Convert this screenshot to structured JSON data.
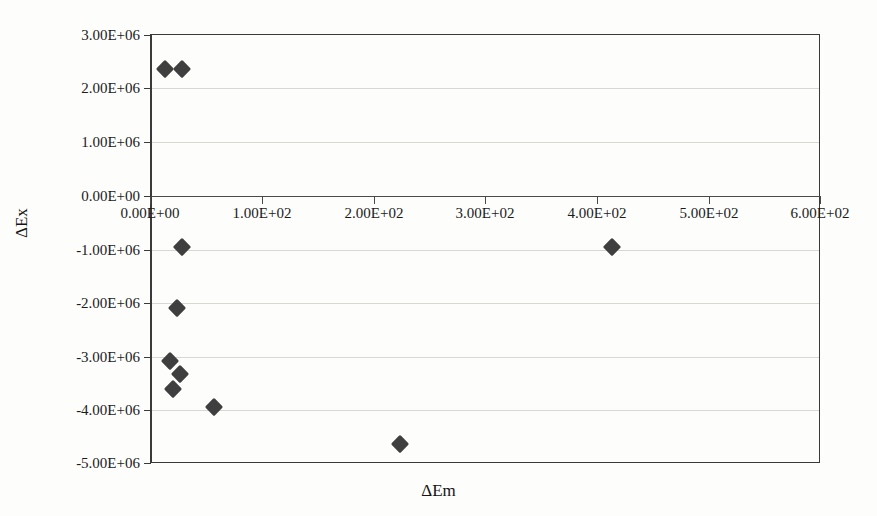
{
  "figure": {
    "background_color": "#fdfdfc",
    "marker_color": "#3f3f3f",
    "axis_color": "#3a3a3a",
    "gridline_color": "#d9d7d2"
  },
  "chart_data": {
    "type": "scatter",
    "title": "",
    "xlabel": "ΔEm",
    "ylabel": "ΔEx",
    "xlim": [
      0,
      600
    ],
    "ylim": [
      -5000000,
      3000000
    ],
    "grid": true,
    "legend": "none",
    "xticks": [
      0,
      100,
      200,
      300,
      400,
      500,
      600
    ],
    "xtick_labels": [
      "0.00E+00",
      "1.00E+02",
      "2.00E+02",
      "3.00E+02",
      "4.00E+02",
      "5.00E+02",
      "6.00E+02"
    ],
    "yticks": [
      3000000,
      2000000,
      1000000,
      0,
      -1000000,
      -2000000,
      -3000000,
      -4000000,
      -5000000
    ],
    "ytick_labels": [
      "3.00E+06",
      "2.00E+06",
      "1.00E+06",
      "0.00E+00",
      "-1.00E+06",
      "-2.00E+06",
      "-3.00E+06",
      "-4.00E+06",
      "-5.00E+06"
    ],
    "series": [
      {
        "name": "data",
        "marker": "diamond",
        "points": [
          {
            "x": 13,
            "y": 2340000
          },
          {
            "x": 29,
            "y": 2340000
          },
          {
            "x": 29,
            "y": -980000
          },
          {
            "x": 24,
            "y": -2110000
          },
          {
            "x": 18,
            "y": -3100000
          },
          {
            "x": 27,
            "y": -3340000
          },
          {
            "x": 21,
            "y": -3620000
          },
          {
            "x": 57,
            "y": -3960000
          },
          {
            "x": 224,
            "y": -4640000
          },
          {
            "x": 414,
            "y": -980000
          }
        ]
      }
    ]
  }
}
